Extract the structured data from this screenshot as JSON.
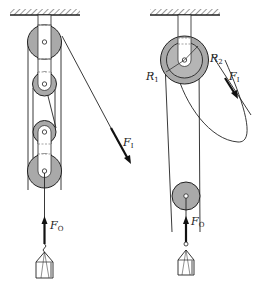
{
  "diagram": {
    "colors": {
      "wheel_fill": "#a9a9a9",
      "inner_fill": "#c4c4c4",
      "line": "#222222",
      "strap": "#ffffff"
    },
    "left": {
      "name": "block-and-tackle",
      "labels": {
        "effort": {
          "main": "F",
          "sub": "I"
        },
        "load": {
          "main": "F",
          "sub": "O"
        }
      }
    },
    "right": {
      "name": "differential-pulley",
      "labels": {
        "effort": {
          "main": "F",
          "sub": "I"
        },
        "load": {
          "main": "F",
          "sub": "O"
        },
        "radius1": {
          "main": "R",
          "sub": "1"
        },
        "radius2": {
          "main": "R",
          "sub": "2"
        }
      }
    }
  }
}
